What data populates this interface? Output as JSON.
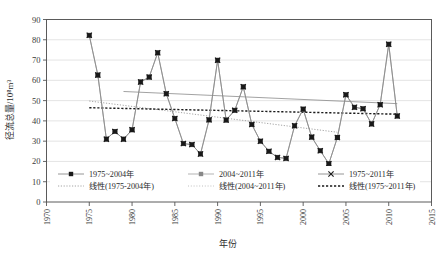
{
  "chart_data": {
    "type": "line",
    "title": "",
    "xlabel": "年份",
    "ylabel": "径流总量/10⁸m³",
    "xlim": [
      1970,
      2015
    ],
    "ylim": [
      0,
      90
    ],
    "xticks": [
      1970,
      1975,
      1980,
      1985,
      1990,
      1995,
      2000,
      2005,
      2010,
      2015
    ],
    "yticks": [
      0,
      10,
      20,
      30,
      40,
      50,
      60,
      70,
      80,
      90
    ],
    "grid": true,
    "legend_position": "inside-bottom",
    "series": [
      {
        "name": "1975~2004年",
        "marker": "square",
        "x": [
          1975,
          1976,
          1977,
          1978,
          1979,
          1980,
          1981,
          1982,
          1983,
          1984,
          1985,
          1986,
          1987,
          1988,
          1989,
          1990,
          1991,
          1992,
          1993,
          1994,
          1995,
          1996,
          1997,
          1998,
          1999,
          2000,
          2001,
          2002,
          2003,
          2004
        ],
        "values": [
          82.2,
          62.6,
          31.0,
          34.8,
          31.0,
          35.6,
          59.2,
          61.6,
          73.6,
          53.4,
          41.2,
          28.8,
          28.3,
          23.7,
          40.5,
          69.9,
          40.4,
          45.2,
          56.8,
          38.2,
          30.0,
          25.0,
          22.0,
          21.5,
          37.6,
          45.8,
          32.0,
          25.3,
          18.9,
          31.8
        ]
      },
      {
        "name": "2004~2011年",
        "marker": "square",
        "x": [
          2004,
          2005,
          2006,
          2007,
          2008,
          2009,
          2010,
          2011
        ],
        "values": [
          31.8,
          52.9,
          46.7,
          46.0,
          38.5,
          48.0,
          77.8,
          42.4
        ]
      },
      {
        "name": "1975~2011年",
        "marker": "x",
        "x": [
          1975,
          1976,
          1977,
          1978,
          1979,
          1980,
          1981,
          1982,
          1983,
          1984,
          1985,
          1986,
          1987,
          1988,
          1989,
          1990,
          1991,
          1992,
          1993,
          1994,
          1995,
          1996,
          1997,
          1998,
          1999,
          2000,
          2001,
          2002,
          2003,
          2004,
          2005,
          2006,
          2007,
          2008,
          2009,
          2010,
          2011
        ],
        "values": [
          82.2,
          62.6,
          31.0,
          34.8,
          31.0,
          35.6,
          59.2,
          61.6,
          73.6,
          53.4,
          41.2,
          28.8,
          28.3,
          23.7,
          40.5,
          69.9,
          40.4,
          45.2,
          56.8,
          38.2,
          30.0,
          25.0,
          22.0,
          21.5,
          37.6,
          45.8,
          32.0,
          25.3,
          18.9,
          31.8,
          52.9,
          46.7,
          46.0,
          38.5,
          48.0,
          77.8,
          42.4
        ]
      }
    ],
    "trendlines": [
      {
        "name": "线性(1975~2004年)",
        "style": "dotted-thin",
        "x": [
          1975,
          2004
        ],
        "y": [
          49.8,
          34.4
        ]
      },
      {
        "name": "线性(2004~2011年)",
        "style": "dotted-light",
        "x": [
          1979,
          2011
        ],
        "y": [
          54.5,
          48.5
        ]
      },
      {
        "name": "线性(1975~2011年)",
        "style": "dotted-bold",
        "x": [
          1975,
          2011
        ],
        "y": [
          46.5,
          43.3
        ]
      }
    ],
    "legend_entries": [
      {
        "label": "1975~2004年",
        "marker": "square",
        "kind": "series"
      },
      {
        "label": "2004~2011年",
        "marker": "square-gray",
        "kind": "series"
      },
      {
        "label": "1975~2011年",
        "marker": "x",
        "kind": "series"
      },
      {
        "label": "线性(1975-2004年)",
        "marker": "dotted-thin",
        "kind": "trend"
      },
      {
        "label": "线性(2004~2011年)",
        "marker": "dotted-light",
        "kind": "trend"
      },
      {
        "label": "线性(1975~2011年)",
        "marker": "dotted-bold",
        "kind": "trend"
      }
    ],
    "colors": {
      "marker": "#1a1a1a",
      "series_line": "#8a8a8a",
      "grid": "#d9d9d9",
      "axis": "#555555",
      "background": "#ffffff"
    }
  }
}
